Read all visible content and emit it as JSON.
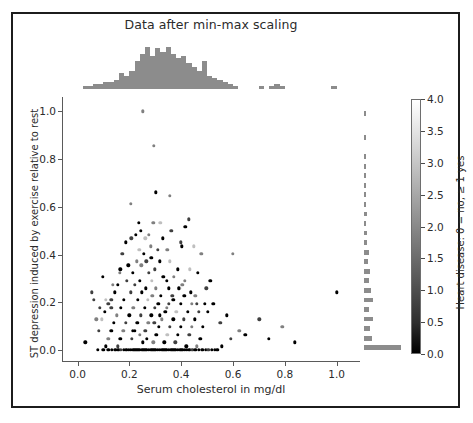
{
  "chart_data": {
    "type": "scatter",
    "title": "Data after min-max scaling",
    "xlabel": "Serum cholesterol in mg/dl",
    "ylabel": "ST depression induced by exercise relative to rest",
    "xlim": [
      -0.06,
      1.09
    ],
    "ylim": [
      -0.05,
      1.06
    ],
    "grid": false,
    "legend": null,
    "xticks": [
      "0.0",
      "0.2",
      "0.4",
      "0.6",
      "0.8",
      "1.0"
    ],
    "xtick_values": [
      0.0,
      0.2,
      0.4,
      0.6,
      0.8,
      1.0
    ],
    "yticks": [
      "0.0",
      "0.2",
      "0.4",
      "0.6",
      "0.8",
      "1.0"
    ],
    "ytick_values": [
      0.0,
      0.2,
      0.4,
      0.6,
      0.8,
      1.0
    ],
    "colorbar": {
      "label": "Heart disease: 0 = no, ≥ 1 yes",
      "ticks": [
        "0.0",
        "0.5",
        "1.0",
        "1.5",
        "2.0",
        "2.5",
        "3.0",
        "3.5",
        "4.0"
      ],
      "tick_values": [
        0.0,
        0.5,
        1.0,
        1.5,
        2.0,
        2.5,
        3.0,
        3.5,
        4.0
      ],
      "vmin": 0.0,
      "vmax": 4.0,
      "colormap": "gray",
      "low_color": "#000000",
      "high_color": "#ffffff"
    },
    "marginal_color": "#8c8c8c",
    "top_histogram": {
      "orientation": "vertical",
      "bin_edges": [
        0.02,
        0.04,
        0.06,
        0.08,
        0.1,
        0.12,
        0.14,
        0.16,
        0.18,
        0.2,
        0.22,
        0.24,
        0.26,
        0.28,
        0.3,
        0.32,
        0.34,
        0.36,
        0.38,
        0.4,
        0.42,
        0.44,
        0.46,
        0.48,
        0.5,
        0.52,
        0.54,
        0.56,
        0.58,
        0.6,
        0.62,
        0.64,
        0.66,
        0.68,
        0.7,
        0.72,
        0.74,
        0.76,
        0.78,
        0.8,
        0.82,
        0.84,
        0.86,
        0.88,
        0.9,
        0.92,
        0.94,
        0.96,
        0.98,
        1.0,
        1.02
      ],
      "counts": [
        1,
        1,
        2,
        2,
        3,
        3,
        4,
        8,
        6,
        9,
        14,
        18,
        22,
        17,
        21,
        19,
        22,
        18,
        16,
        17,
        13,
        11,
        9,
        14,
        6,
        5,
        4,
        3,
        2,
        1,
        0,
        0,
        0,
        0,
        1,
        0,
        1,
        2,
        1,
        0,
        0,
        0,
        0,
        0,
        0,
        0,
        0,
        0,
        1,
        0
      ],
      "max_count": 22
    },
    "right_histogram": {
      "orientation": "horizontal",
      "bin_edges": [
        0.0,
        0.02,
        0.04,
        0.06,
        0.08,
        0.1,
        0.12,
        0.14,
        0.16,
        0.18,
        0.2,
        0.22,
        0.24,
        0.26,
        0.28,
        0.3,
        0.32,
        0.34,
        0.36,
        0.38,
        0.4,
        0.42,
        0.44,
        0.46,
        0.48,
        0.5,
        0.52,
        0.54,
        0.56,
        0.58,
        0.6,
        0.62,
        0.64,
        0.66,
        0.68,
        0.7,
        0.72,
        0.74,
        0.76,
        0.78,
        0.8,
        0.82,
        0.84,
        0.86,
        0.88,
        0.9,
        0.92,
        0.94,
        0.96,
        0.98,
        1.0
      ],
      "counts": [
        96,
        0,
        18,
        0,
        14,
        0,
        20,
        0,
        10,
        0,
        22,
        0,
        16,
        0,
        11,
        0,
        13,
        0,
        7,
        0,
        9,
        0,
        5,
        0,
        6,
        0,
        3,
        0,
        4,
        0,
        2,
        0,
        3,
        0,
        1,
        0,
        2,
        0,
        1,
        0,
        1,
        0,
        0,
        0,
        1,
        0,
        0,
        0,
        0,
        1
      ],
      "max_count": 96
    },
    "points": [
      [
        0.252,
        1.0,
        2
      ],
      [
        0.295,
        0.855,
        2
      ],
      [
        0.303,
        0.661,
        0
      ],
      [
        0.356,
        0.645,
        2
      ],
      [
        0.206,
        0.613,
        2
      ],
      [
        0.236,
        0.532,
        0
      ],
      [
        0.292,
        0.532,
        2
      ],
      [
        0.319,
        0.532,
        3
      ],
      [
        0.416,
        0.516,
        0
      ],
      [
        0.225,
        0.484,
        0
      ],
      [
        0.274,
        0.484,
        2
      ],
      [
        0.262,
        0.468,
        3
      ],
      [
        0.399,
        0.452,
        1
      ],
      [
        0.186,
        0.452,
        0
      ],
      [
        0.238,
        0.419,
        3
      ],
      [
        0.309,
        0.419,
        1
      ],
      [
        0.346,
        0.419,
        2
      ],
      [
        0.255,
        0.403,
        0
      ],
      [
        0.173,
        0.403,
        1
      ],
      [
        0.599,
        0.403,
        2
      ],
      [
        0.285,
        0.387,
        0
      ],
      [
        0.228,
        0.371,
        2
      ],
      [
        0.266,
        0.371,
        1
      ],
      [
        0.318,
        0.371,
        0
      ],
      [
        0.355,
        0.371,
        3
      ],
      [
        0.196,
        0.355,
        0
      ],
      [
        0.246,
        0.355,
        2
      ],
      [
        0.299,
        0.339,
        1
      ],
      [
        0.386,
        0.339,
        0
      ],
      [
        0.433,
        0.339,
        3
      ],
      [
        0.163,
        0.323,
        2
      ],
      [
        0.213,
        0.323,
        0
      ],
      [
        0.276,
        0.323,
        1
      ],
      [
        0.331,
        0.306,
        0
      ],
      [
        0.372,
        0.306,
        2
      ],
      [
        0.191,
        0.29,
        1
      ],
      [
        0.241,
        0.29,
        0
      ],
      [
        0.286,
        0.29,
        3
      ],
      [
        0.344,
        0.29,
        0
      ],
      [
        0.405,
        0.274,
        2
      ],
      [
        0.156,
        0.274,
        0
      ],
      [
        0.222,
        0.274,
        1
      ],
      [
        0.263,
        0.258,
        0
      ],
      [
        0.303,
        0.258,
        2
      ],
      [
        0.351,
        0.258,
        0
      ],
      [
        0.392,
        0.258,
        3
      ],
      [
        0.143,
        0.242,
        0
      ],
      [
        0.205,
        0.242,
        1
      ],
      [
        0.248,
        0.242,
        0
      ],
      [
        0.289,
        0.226,
        2
      ],
      [
        0.322,
        0.226,
        0
      ],
      [
        0.366,
        0.226,
        1
      ],
      [
        0.412,
        0.226,
        0
      ],
      [
        0.455,
        0.226,
        2
      ],
      [
        0.131,
        0.21,
        1
      ],
      [
        0.178,
        0.21,
        0
      ],
      [
        0.232,
        0.21,
        0
      ],
      [
        0.271,
        0.21,
        3
      ],
      [
        0.311,
        0.194,
        0
      ],
      [
        0.353,
        0.194,
        1
      ],
      [
        0.398,
        0.194,
        0
      ],
      [
        0.441,
        0.194,
        2
      ],
      [
        0.49,
        0.194,
        0
      ],
      [
        0.118,
        0.194,
        1
      ],
      [
        0.168,
        0.177,
        0
      ],
      [
        0.215,
        0.177,
        2
      ],
      [
        0.259,
        0.177,
        0
      ],
      [
        0.297,
        0.177,
        1
      ],
      [
        0.338,
        0.161,
        0
      ],
      [
        0.381,
        0.161,
        3
      ],
      [
        0.425,
        0.161,
        0
      ],
      [
        0.468,
        0.161,
        1
      ],
      [
        0.105,
        0.161,
        0
      ],
      [
        0.152,
        0.145,
        2
      ],
      [
        0.199,
        0.145,
        0
      ],
      [
        0.243,
        0.145,
        1
      ],
      [
        0.284,
        0.145,
        0
      ],
      [
        0.325,
        0.129,
        2
      ],
      [
        0.369,
        0.129,
        0
      ],
      [
        0.41,
        0.129,
        1
      ],
      [
        0.453,
        0.129,
        0
      ],
      [
        0.094,
        0.129,
        3
      ],
      [
        0.141,
        0.113,
        0
      ],
      [
        0.187,
        0.113,
        1
      ],
      [
        0.231,
        0.113,
        0
      ],
      [
        0.273,
        0.113,
        2
      ],
      [
        0.314,
        0.097,
        0
      ],
      [
        0.357,
        0.097,
        1
      ],
      [
        0.399,
        0.097,
        0
      ],
      [
        0.442,
        0.097,
        2
      ],
      [
        0.484,
        0.097,
        0
      ],
      [
        0.083,
        0.081,
        1
      ],
      [
        0.13,
        0.081,
        0
      ],
      [
        0.176,
        0.081,
        2
      ],
      [
        0.22,
        0.081,
        0
      ],
      [
        0.262,
        0.081,
        1
      ],
      [
        0.304,
        0.065,
        0
      ],
      [
        0.346,
        0.065,
        3
      ],
      [
        0.388,
        0.065,
        0
      ],
      [
        0.431,
        0.065,
        1
      ],
      [
        0.474,
        0.048,
        0
      ],
      [
        0.119,
        0.048,
        2
      ],
      [
        0.165,
        0.048,
        0
      ],
      [
        0.209,
        0.048,
        1
      ],
      [
        0.251,
        0.032,
        0
      ],
      [
        0.293,
        0.032,
        2
      ],
      [
        0.335,
        0.032,
        0
      ],
      [
        0.377,
        0.032,
        1
      ],
      [
        0.419,
        0.016,
        0
      ],
      [
        0.461,
        0.016,
        2
      ],
      [
        0.108,
        0.016,
        0
      ],
      [
        0.155,
        0.016,
        1
      ],
      [
        0.078,
        0.0,
        0
      ],
      [
        0.1,
        0.0,
        0
      ],
      [
        0.118,
        0.0,
        0
      ],
      [
        0.132,
        0.0,
        0
      ],
      [
        0.145,
        0.0,
        0
      ],
      [
        0.158,
        0.0,
        0
      ],
      [
        0.168,
        0.0,
        1
      ],
      [
        0.178,
        0.0,
        0
      ],
      [
        0.188,
        0.0,
        0
      ],
      [
        0.197,
        0.0,
        0
      ],
      [
        0.206,
        0.0,
        0
      ],
      [
        0.215,
        0.0,
        0
      ],
      [
        0.223,
        0.0,
        0
      ],
      [
        0.231,
        0.0,
        0
      ],
      [
        0.239,
        0.0,
        0
      ],
      [
        0.247,
        0.0,
        0
      ],
      [
        0.254,
        0.0,
        0
      ],
      [
        0.261,
        0.0,
        0
      ],
      [
        0.268,
        0.0,
        0
      ],
      [
        0.275,
        0.0,
        0
      ],
      [
        0.282,
        0.0,
        0
      ],
      [
        0.289,
        0.0,
        0
      ],
      [
        0.296,
        0.0,
        0
      ],
      [
        0.303,
        0.0,
        0
      ],
      [
        0.31,
        0.0,
        0
      ],
      [
        0.317,
        0.0,
        0
      ],
      [
        0.324,
        0.0,
        0
      ],
      [
        0.331,
        0.0,
        0
      ],
      [
        0.338,
        0.0,
        0
      ],
      [
        0.345,
        0.0,
        0
      ],
      [
        0.352,
        0.0,
        0
      ],
      [
        0.359,
        0.0,
        0
      ],
      [
        0.366,
        0.0,
        0
      ],
      [
        0.373,
        0.0,
        0
      ],
      [
        0.38,
        0.0,
        0
      ],
      [
        0.388,
        0.0,
        0
      ],
      [
        0.396,
        0.0,
        0
      ],
      [
        0.404,
        0.0,
        0
      ],
      [
        0.413,
        0.0,
        0
      ],
      [
        0.422,
        0.0,
        0
      ],
      [
        0.432,
        0.0,
        0
      ],
      [
        0.443,
        0.0,
        1
      ],
      [
        0.455,
        0.0,
        0
      ],
      [
        0.468,
        0.0,
        0
      ],
      [
        0.482,
        0.0,
        0
      ],
      [
        0.494,
        0.0,
        0
      ],
      [
        0.505,
        0.0,
        1
      ],
      [
        0.517,
        0.0,
        0
      ],
      [
        0.529,
        0.0,
        0
      ],
      [
        0.54,
        0.0,
        0
      ],
      [
        0.03,
        0.032,
        0
      ],
      [
        0.063,
        0.21,
        1
      ],
      [
        0.073,
        0.129,
        2
      ],
      [
        0.055,
        0.242,
        1
      ],
      [
        0.108,
        0.21,
        3
      ],
      [
        0.503,
        0.161,
        0
      ],
      [
        0.524,
        0.194,
        0
      ],
      [
        0.551,
        0.113,
        1
      ],
      [
        0.577,
        0.145,
        0
      ],
      [
        0.624,
        0.081,
        2
      ],
      [
        0.648,
        0.065,
        0
      ],
      [
        0.702,
        0.129,
        1
      ],
      [
        0.738,
        0.048,
        0
      ],
      [
        0.79,
        0.097,
        2
      ],
      [
        0.838,
        0.032,
        0
      ],
      [
        1.0,
        0.242,
        0
      ],
      [
        0.592,
        0.048,
        1
      ],
      [
        0.556,
        0.016,
        0
      ],
      [
        0.43,
        0.548,
        1
      ],
      [
        0.465,
        0.323,
        0
      ],
      [
        0.478,
        0.403,
        2
      ],
      [
        0.497,
        0.258,
        1
      ],
      [
        0.512,
        0.29,
        0
      ],
      [
        0.448,
        0.435,
        3
      ],
      [
        0.402,
        0.435,
        0
      ],
      [
        0.362,
        0.5,
        1
      ],
      [
        0.328,
        0.468,
        0
      ],
      [
        0.282,
        0.435,
        2
      ],
      [
        0.245,
        0.5,
        0
      ],
      [
        0.208,
        0.468,
        1
      ],
      [
        0.165,
        0.339,
        0
      ],
      [
        0.135,
        0.274,
        2
      ],
      [
        0.098,
        0.306,
        0
      ],
      [
        0.087,
        0.177,
        1
      ],
      [
        0.213,
        0.081,
        0
      ],
      [
        0.24,
        0.065,
        2
      ],
      [
        0.267,
        0.048,
        0
      ],
      [
        0.13,
        0.177,
        1
      ],
      [
        0.37,
        0.21,
        0
      ],
      [
        0.345,
        0.177,
        2
      ],
      [
        0.318,
        0.145,
        0
      ],
      [
        0.296,
        0.113,
        1
      ],
      [
        0.39,
        0.258,
        0
      ],
      [
        0.415,
        0.29,
        2
      ],
      [
        0.437,
        0.242,
        0
      ],
      [
        0.46,
        0.194,
        1
      ]
    ]
  }
}
